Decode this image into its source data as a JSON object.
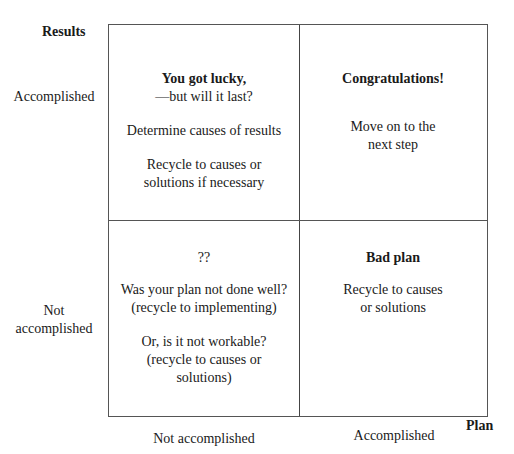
{
  "axes": {
    "y_title": "Results",
    "x_title": "Plan",
    "rows": [
      "Accomplished",
      "Not accomplished"
    ],
    "row_lines": [
      [
        "Accomplished"
      ],
      [
        "Not",
        "accomplished"
      ]
    ],
    "columns": [
      "Not accomplished",
      "Accomplished"
    ]
  },
  "quadrants": {
    "top_left": {
      "heading": "You got lucky,",
      "subheading": "—but will it last?",
      "text1": "Determine causes of results",
      "text2_line1": "Recycle to causes or",
      "text2_line2": "solutions if necessary"
    },
    "top_right": {
      "heading": "Congratulations!",
      "text1_line1": "Move on to the",
      "text1_line2": "next step"
    },
    "bottom_left": {
      "heading": "??",
      "text1_line1": "Was your plan not done well?",
      "text1_line2": "(recycle to implementing)",
      "text2_line1": "Or, is it not workable?",
      "text2_line2": "(recycle to causes or",
      "text2_line3": "solutions)"
    },
    "bottom_right": {
      "heading": "Bad plan",
      "text1_line1": "Recycle to causes",
      "text1_line2": "or solutions"
    }
  }
}
